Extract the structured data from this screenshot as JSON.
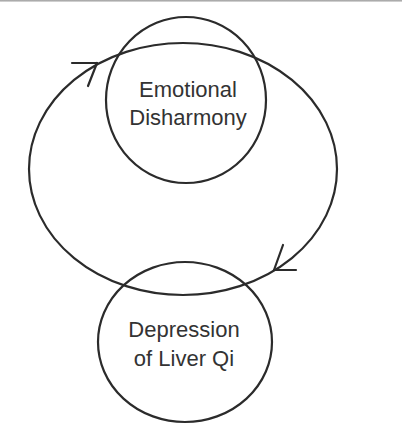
{
  "diagram": {
    "type": "cycle",
    "nodes": [
      {
        "id": "emotional",
        "lines": [
          "Emotional",
          "Disharmony"
        ]
      },
      {
        "id": "liver",
        "lines": [
          "Depression",
          "of Liver Qi"
        ]
      }
    ],
    "edges": [
      {
        "from": "emotional",
        "to": "liver",
        "direction": "clockwise"
      },
      {
        "from": "liver",
        "to": "emotional",
        "direction": "clockwise"
      }
    ],
    "colors": {
      "stroke": "#2b2b2b",
      "text": "#333333",
      "background": "#ffffff"
    }
  }
}
